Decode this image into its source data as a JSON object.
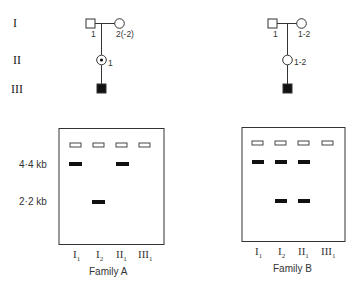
{
  "generations": [
    "I",
    "II",
    "III"
  ],
  "family_a": {
    "name": "Family A",
    "pedigree": {
      "I_father_label": "1",
      "I_mother_label": "2(-2)",
      "II_label": "1",
      "II_symbol": "carrier-female (dotted circle)",
      "III_symbol": "affected-male (filled square)"
    },
    "gel": {
      "lanes": [
        {
          "label": "I",
          "sub": "1",
          "bands_kb": [
            4.4
          ]
        },
        {
          "label": "I",
          "sub": "2",
          "bands_kb": [
            2.2
          ]
        },
        {
          "label": "II",
          "sub": "1",
          "bands_kb": [
            4.4
          ]
        },
        {
          "label": "III",
          "sub": "1",
          "bands_kb": []
        }
      ]
    }
  },
  "family_b": {
    "name": "Family B",
    "pedigree": {
      "I_father_label": "1",
      "I_mother_label": "1-2",
      "II_label": "1-2",
      "II_symbol": "female (open circle)",
      "III_symbol": "affected-male (filled square)"
    },
    "gel": {
      "lanes": [
        {
          "label": "I",
          "sub": "1",
          "bands_kb": [
            4.4
          ]
        },
        {
          "label": "I",
          "sub": "2",
          "bands_kb": [
            4.4,
            2.2
          ]
        },
        {
          "label": "II",
          "sub": "1",
          "bands_kb": [
            4.4,
            2.2
          ]
        },
        {
          "label": "III",
          "sub": "1",
          "bands_kb": []
        }
      ]
    }
  },
  "size_markers": [
    "4·4 kb",
    "2·2 kb"
  ]
}
